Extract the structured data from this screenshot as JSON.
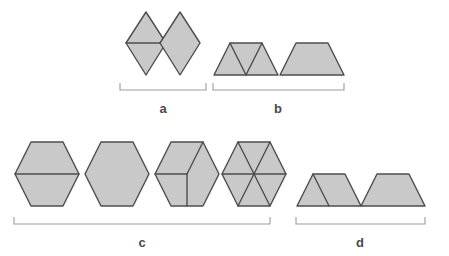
{
  "figure": {
    "colors": {
      "background": "#ffffff",
      "tile_fill": "#c9c9c9",
      "tile_stroke": "#4d4d4d",
      "divider_stroke": "#4d4d4d",
      "bracket_stroke": "#9b9b9b",
      "label_text": "#4a4a4a"
    },
    "stroke_widths": {
      "tile": 1.4,
      "divider": 1.4,
      "bracket": 1.1
    }
  },
  "groups": [
    {
      "id": "a",
      "label": "a",
      "label_x": 163,
      "label_y": 113,
      "bracket": {
        "x1": 120,
        "x2": 206,
        "y": 90,
        "tick": 7
      },
      "shapes": [
        {
          "name": "rhombus-divided",
          "points": "146,12 166,43 146,75 126,43",
          "dividers": [
            "126,43 166,43"
          ]
        },
        {
          "name": "rhombus-whole",
          "points": "180,12 200,43 180,75 160,43",
          "dividers": []
        }
      ]
    },
    {
      "id": "b",
      "label": "b",
      "label_x": 278,
      "label_y": 113,
      "bracket": {
        "x1": 213,
        "x2": 344,
        "y": 90,
        "tick": 7
      },
      "shapes": [
        {
          "name": "trapezoid-three-triangles",
          "points": "230,43 262,43 278,75 214,75",
          "dividers": [
            "230,43 246,75",
            "262,43 246,75"
          ]
        },
        {
          "name": "trapezoid-whole",
          "points": "296,43 328,43 344,75 280,75",
          "dividers": []
        }
      ]
    },
    {
      "id": "c",
      "label": "c",
      "label_x": 142,
      "label_y": 247,
      "bracket": {
        "x1": 14,
        "x2": 270,
        "y": 224,
        "tick": 7
      },
      "shapes": [
        {
          "name": "hexagon-two-trapezoids",
          "points": "31,142 63,142 79,174 63,206 31,206 15,174",
          "dividers": [
            "15,174 79,174"
          ]
        },
        {
          "name": "hexagon-whole",
          "points": "101,142 133,142 149,174 133,206 101,206 85,174",
          "dividers": []
        },
        {
          "name": "hexagon-three-rhombi",
          "points": "171,142 203,142 219,174 203,206 171,206 155,174",
          "dividers": [
            "187,174 155,174",
            "187,174 203,142",
            "187,174 187,206"
          ]
        },
        {
          "name": "hexagon-six-triangles",
          "points": "238,142 270,142 286,174 270,206 238,206 222,174",
          "dividers": [
            "254,174 222,174",
            "254,174 286,174",
            "254,174 238,142",
            "254,174 270,142",
            "254,174 238,206",
            "254,174 270,206"
          ]
        }
      ]
    },
    {
      "id": "d",
      "label": "d",
      "label_x": 360,
      "label_y": 247,
      "bracket": {
        "x1": 296,
        "x2": 425,
        "y": 224,
        "tick": 7
      },
      "shapes": [
        {
          "name": "trapezoid-triangle-and-trapezoid",
          "points": "313,174 345,174 361,206 297,206",
          "dividers": [
            "313,174 329,206"
          ]
        },
        {
          "name": "trapezoid-whole",
          "points": "377,174 409,174 425,206 361,206",
          "dividers": []
        }
      ]
    }
  ]
}
